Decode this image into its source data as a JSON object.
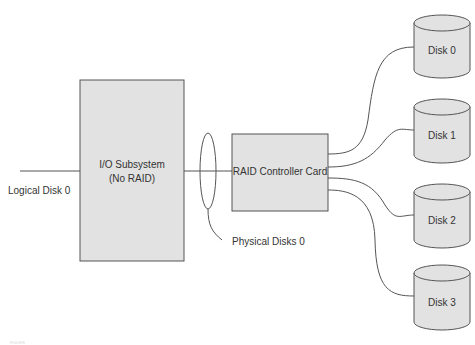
{
  "diagram": {
    "logical_disk_label": "Logical Disk 0",
    "io_subsystem": {
      "line1": "I/O Subsystem",
      "line2": "(No RAID)"
    },
    "raid_card": {
      "label": "RAID Controller Card"
    },
    "physical_disks_label": "Physical Disks 0",
    "disks": [
      {
        "label": "Disk 0"
      },
      {
        "label": "Disk 1"
      },
      {
        "label": "Disk 2"
      },
      {
        "label": "Disk 3"
      }
    ],
    "caption": "FIGURE"
  },
  "colors": {
    "box_fill": "#e2e2e2",
    "stroke": "#555555",
    "text": "#333333"
  }
}
